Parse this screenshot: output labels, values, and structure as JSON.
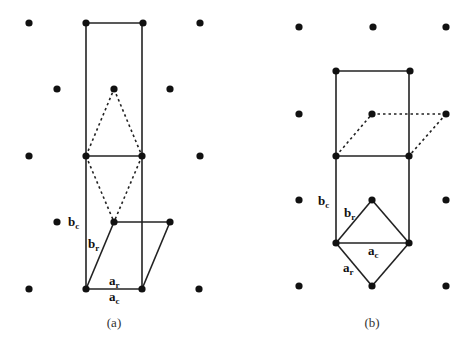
{
  "figure": {
    "panels": [
      {
        "id": "a",
        "caption": "(a)",
        "labels": {
          "b_c": {
            "main": "b",
            "sub": "c"
          },
          "b_r": {
            "main": "b",
            "sub": "r"
          },
          "a_r": {
            "main": "a",
            "sub": "r"
          },
          "a_c": {
            "main": "a",
            "sub": "c"
          }
        },
        "lattice_points": [
          [
            29,
            23
          ],
          [
            86,
            23
          ],
          [
            143,
            23
          ],
          [
            200,
            23
          ],
          [
            57,
            89
          ],
          [
            114,
            89
          ],
          [
            170,
            89
          ],
          [
            29,
            156
          ],
          [
            86,
            156
          ],
          [
            142,
            156
          ],
          [
            200,
            156
          ],
          [
            57,
            222
          ],
          [
            114,
            222
          ],
          [
            170,
            222
          ],
          [
            29,
            289
          ],
          [
            86,
            289
          ],
          [
            142,
            289
          ],
          [
            199,
            289
          ]
        ],
        "conventional_cell": "rectangle from (86,23) to (142,289) with midline at y=156",
        "rhombohedral_cell": "parallelogram (86,289)-(142,289)-(170,222)-(114,222)",
        "dashed_rhombus": "(86,156)-(114,89)-(142,156)-(114,222)"
      },
      {
        "id": "b",
        "caption": "(b)",
        "labels": {
          "b_c": {
            "main": "b",
            "sub": "c"
          },
          "b_r": {
            "main": "b",
            "sub": "r"
          },
          "a_c": {
            "main": "a",
            "sub": "c"
          },
          "a_r": {
            "main": "a",
            "sub": "r"
          }
        },
        "lattice_points": [
          [
            299,
            27
          ],
          [
            373,
            27
          ],
          [
            446,
            27
          ],
          [
            336,
            71
          ],
          [
            410,
            71
          ],
          [
            299,
            114
          ],
          [
            372,
            114
          ],
          [
            446,
            114
          ],
          [
            336,
            156
          ],
          [
            409,
            156
          ],
          [
            299,
            200
          ],
          [
            372,
            200
          ],
          [
            446,
            200
          ],
          [
            336,
            243
          ],
          [
            409,
            243
          ],
          [
            299,
            286
          ],
          [
            372,
            286
          ],
          [
            446,
            286
          ]
        ],
        "conventional_cell": "rectangle from (336,71) to (409,243) with midline at y=156",
        "rhombus_cell": "(336,243)-(372,200)-(409,243)-(372,286)",
        "dashed_parallelogram": "(336,156)-(372,114)-(446,114)-(409,156)"
      }
    ]
  }
}
